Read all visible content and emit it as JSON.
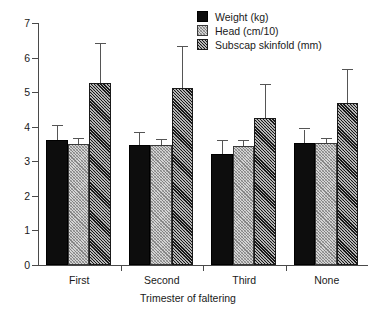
{
  "chart_data": {
    "type": "bar",
    "title": "",
    "subtitle": "",
    "xlabel": "Trimester of faltering",
    "ylabel": "",
    "categories": [
      "First",
      "Second",
      "Third",
      "None"
    ],
    "ylim": [
      0,
      7
    ],
    "yticks": [
      0,
      1,
      2,
      3,
      4,
      5,
      6,
      7
    ],
    "ytick_labels": [
      "0",
      "1",
      "2",
      "3",
      "4",
      "5",
      "6",
      "7"
    ],
    "grid": false,
    "legend_position": "top-right",
    "error_bars": "upper-only",
    "series": [
      {
        "name": "Weight (kg)",
        "pattern": "solid-black",
        "color": "#0d0d0d",
        "values": [
          3.62,
          3.47,
          3.2,
          3.54
        ],
        "error_upper": [
          4.02,
          3.83,
          3.58,
          3.92
        ]
      },
      {
        "name": "Head (cm/10)",
        "pattern": "light-hatch",
        "color": "#d5d5d5",
        "values": [
          3.5,
          3.48,
          3.45,
          3.53
        ],
        "error_upper": [
          3.64,
          3.62,
          3.58,
          3.65
        ]
      },
      {
        "name": "Subscap skinfold (mm)",
        "pattern": "dark-hatch",
        "color": "#6b6b6b",
        "values": [
          5.27,
          5.12,
          4.26,
          4.68
        ],
        "error_upper": [
          6.4,
          6.3,
          5.2,
          5.65
        ]
      }
    ]
  },
  "legend": {
    "items": [
      {
        "label": "Weight (kg)"
      },
      {
        "label": "Head (cm/10)"
      },
      {
        "label": "Subscap skinfold (mm)"
      }
    ]
  },
  "axes": {
    "x_title": "Trimester of faltering"
  }
}
